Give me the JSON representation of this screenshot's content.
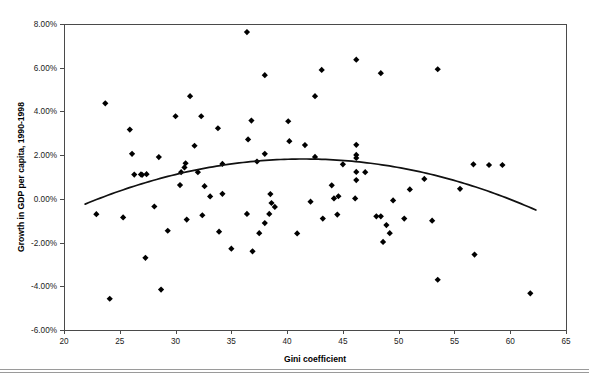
{
  "page": {
    "header_faint_text": "",
    "background_color": "#ffffff"
  },
  "chart_data": {
    "type": "scatter",
    "title": "",
    "xlabel": "Gini coefficient",
    "ylabel": "Growth in GDP per capita, 1990-1998",
    "xlim": [
      20,
      65
    ],
    "ylim": [
      -0.06,
      0.08
    ],
    "xticks": [
      20,
      25,
      30,
      35,
      40,
      45,
      50,
      55,
      60,
      65
    ],
    "xtick_labels": [
      "20",
      "25",
      "30",
      "35",
      "40",
      "45",
      "50",
      "55",
      "60",
      "65"
    ],
    "yticks": [
      0.08,
      0.06,
      0.04,
      0.02,
      0.0,
      -0.02,
      -0.04,
      -0.06
    ],
    "ytick_labels": [
      "8.00%",
      "6.00%",
      "4.00%",
      "2.00%",
      "0.00%",
      "-2.00%",
      "-4.00%",
      "-6.00%"
    ],
    "grid": false,
    "legend": false,
    "marker_color": "#000000",
    "marker_shape": "diamond",
    "marker_size": 3.1,
    "trend_color": "#111111",
    "series": [
      {
        "name": "Countries",
        "points": [
          [
            23.7,
            0.0437
          ],
          [
            24.1,
            -0.0457
          ],
          [
            22.9,
            -0.007
          ],
          [
            25.9,
            0.0317
          ],
          [
            26.1,
            0.0206
          ],
          [
            26.3,
            0.0111
          ],
          [
            26.9,
            0.0112
          ],
          [
            27.0,
            0.011
          ],
          [
            25.3,
            -0.0085
          ],
          [
            27.3,
            -0.027
          ],
          [
            28.5,
            0.0191
          ],
          [
            27.4,
            0.0113
          ],
          [
            28.1,
            -0.0035
          ],
          [
            29.3,
            -0.0146
          ],
          [
            28.7,
            -0.0415
          ],
          [
            31.3,
            0.047
          ],
          [
            30.0,
            0.0378
          ],
          [
            32.3,
            0.0378
          ],
          [
            33.8,
            0.0323
          ],
          [
            31.7,
            0.0243
          ],
          [
            30.8,
            0.0144
          ],
          [
            30.9,
            0.0163
          ],
          [
            30.5,
            0.0122
          ],
          [
            32.0,
            0.0122
          ],
          [
            34.2,
            0.016
          ],
          [
            30.4,
            0.0063
          ],
          [
            32.6,
            0.0058
          ],
          [
            33.1,
            0.0011
          ],
          [
            34.2,
            0.0023
          ],
          [
            32.4,
            -0.0075
          ],
          [
            33.9,
            -0.015
          ],
          [
            35.0,
            -0.0228
          ],
          [
            31.0,
            -0.0095
          ],
          [
            36.4,
            0.0763
          ],
          [
            38.0,
            0.0566
          ],
          [
            42.5,
            0.047
          ],
          [
            36.8,
            0.0358
          ],
          [
            40.1,
            0.0355
          ],
          [
            36.5,
            0.0272
          ],
          [
            40.2,
            0.0264
          ],
          [
            41.6,
            0.0246
          ],
          [
            42.5,
            0.0192
          ],
          [
            38.0,
            0.0206
          ],
          [
            37.3,
            0.0171
          ],
          [
            38.5,
            0.0022
          ],
          [
            38.6,
            -0.0019
          ],
          [
            38.9,
            -0.0037
          ],
          [
            36.4,
            -0.0069
          ],
          [
            38.4,
            -0.0069
          ],
          [
            38.0,
            -0.0111
          ],
          [
            37.5,
            -0.0157
          ],
          [
            36.9,
            -0.024
          ],
          [
            43.2,
            -0.009
          ],
          [
            46.2,
            0.0637
          ],
          [
            43.1,
            0.059
          ],
          [
            46.2,
            0.0247
          ],
          [
            46.2,
            0.0201
          ],
          [
            46.2,
            0.0187
          ],
          [
            46.2,
            0.0123
          ],
          [
            46.2,
            0.0086
          ],
          [
            44.2,
            0.0002
          ],
          [
            44.6,
            0.0012
          ],
          [
            46.1,
            0.0002
          ],
          [
            48.4,
            0.0575
          ],
          [
            47.0,
            0.0122
          ],
          [
            51.0,
            0.0043
          ],
          [
            53.5,
            0.0593
          ],
          [
            49.5,
            -0.0007
          ],
          [
            48.0,
            -0.008
          ],
          [
            48.4,
            -0.008
          ],
          [
            48.9,
            -0.012
          ],
          [
            49.2,
            -0.0157
          ],
          [
            52.3,
            0.0091
          ],
          [
            50.5,
            -0.009
          ],
          [
            53.0,
            -0.01
          ],
          [
            53.5,
            -0.037
          ],
          [
            48.6,
            -0.0197
          ],
          [
            56.7,
            0.0158
          ],
          [
            58.1,
            0.0155
          ],
          [
            59.3,
            0.0155
          ],
          [
            55.5,
            0.0046
          ],
          [
            56.8,
            -0.0255
          ],
          [
            61.8,
            -0.0432
          ],
          [
            45.0,
            0.0158
          ],
          [
            44.0,
            0.0062
          ],
          [
            42.1,
            -0.0013
          ],
          [
            44.5,
            -0.0072
          ],
          [
            40.9,
            -0.0158
          ]
        ]
      }
    ],
    "trend": {
      "name": "Quadratic fit",
      "x_start": 21.9,
      "x_end": 62.3,
      "y_start": -0.0024,
      "y_peak": 0.0182,
      "x_peak": 40.7,
      "y_end": -0.0051
    }
  }
}
